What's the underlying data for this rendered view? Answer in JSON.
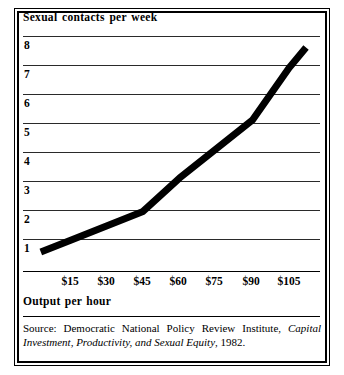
{
  "figure": {
    "title": "Sexual contacts per week",
    "axis_caption": "Output per hour",
    "source_prefix": "Source: Democratic National Policy Review Institute, ",
    "source_title": "Capital Investment, Productivity, and Sexual Equity",
    "source_suffix": ", 1982."
  },
  "chart_data": {
    "type": "line",
    "title": "Sexual contacts per week",
    "xlabel": "Output per hour",
    "ylabel": "Sexual contacts per week",
    "x_tick_labels": [
      "$15",
      "$30",
      "$45",
      "$60",
      "$75",
      "$90",
      "$105"
    ],
    "x_tick_values": [
      15,
      30,
      45,
      60,
      75,
      90,
      105
    ],
    "y_tick_labels": [
      "1",
      "2",
      "3",
      "4",
      "5",
      "6",
      "7",
      "8"
    ],
    "y_tick_values": [
      1,
      2,
      3,
      4,
      5,
      6,
      7,
      8
    ],
    "xlim": [
      0,
      117
    ],
    "ylim": [
      0,
      8.5
    ],
    "grid": true,
    "legend": false,
    "series": [
      {
        "name": "Sexual contacts per week",
        "x": [
          3,
          15,
          30,
          45,
          60,
          75,
          90,
          105,
          112
        ],
        "values": [
          0.55,
          0.95,
          1.45,
          1.95,
          3.1,
          4.1,
          5.1,
          6.9,
          7.6
        ]
      }
    ]
  }
}
